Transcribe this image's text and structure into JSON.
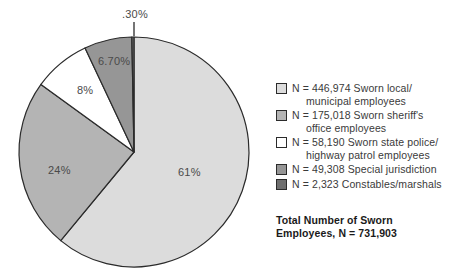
{
  "chart_data": {
    "type": "pie",
    "title": "",
    "subtitle": "",
    "xlabel": "",
    "ylabel": "",
    "legend_position": "right",
    "grid": false,
    "start_angle_deg": 0,
    "direction": "clockwise",
    "categories": [
      "Sworn local/municipal employees",
      "Sworn sheriff's office employees",
      "Sworn state police/highway patrol employees",
      "Special jurisdiction",
      "Constables/marshals"
    ],
    "values": [
      61,
      24,
      8,
      6.7,
      0.3
    ],
    "counts": [
      446974,
      175018,
      58190,
      49308,
      2323
    ],
    "colors": [
      "#dcdcdc",
      "#b4b4b4",
      "#ffffff",
      "#969696",
      "#6e6e6e"
    ],
    "total_label": "Total Number of Sworn Employees",
    "total_value": 731903,
    "slice_labels": [
      "61%",
      "24%",
      "8%",
      "6.70%",
      ".30%"
    ]
  },
  "pie": {
    "labels": {
      "slice_61": "61%",
      "slice_24": "24%",
      "slice_8": "8%",
      "slice_670": "6.70%",
      "slice_030": ".30%"
    }
  },
  "legend": {
    "items": [
      {
        "swatch_color": "#dcdcdc",
        "line1": "N = 446,974 Sworn local/",
        "line2": "municipal employees"
      },
      {
        "swatch_color": "#b4b4b4",
        "line1": "N = 175,018 Sworn sheriff's",
        "line2": "office employees"
      },
      {
        "swatch_color": "#ffffff",
        "line1": "N = 58,190 Sworn state police/",
        "line2": "highway patrol employees"
      },
      {
        "swatch_color": "#969696",
        "line1": "N = 49,308 Special jurisdiction",
        "line2": ""
      },
      {
        "swatch_color": "#6e6e6e",
        "line1": "N = 2,323 Constables/marshals",
        "line2": ""
      }
    ],
    "total_line1": "Total Number of Sworn",
    "total_line2": "Employees, N = 731,903"
  }
}
